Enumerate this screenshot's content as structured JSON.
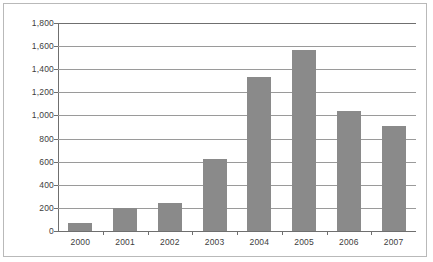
{
  "chart_data": {
    "type": "bar",
    "title": "",
    "subtitle": "",
    "xlabel": "",
    "ylabel": "",
    "categories": [
      "2000",
      "2001",
      "2002",
      "2003",
      "2004",
      "2005",
      "2006",
      "2007"
    ],
    "values": [
      70,
      200,
      240,
      625,
      1330,
      1570,
      1040,
      910
    ],
    "series": [
      {
        "name": "",
        "values": [
          70,
          200,
          240,
          625,
          1330,
          1570,
          1040,
          910
        ]
      }
    ],
    "ylim": [
      0,
      1800
    ],
    "ytick_values": [
      0,
      200,
      400,
      600,
      800,
      1000,
      1200,
      1400,
      1600,
      1800
    ],
    "ytick_labels": [
      "0",
      "200",
      "400",
      "600",
      "800",
      "1,000",
      "1,200",
      "1,400",
      "1,600",
      "1,800"
    ],
    "grid": true,
    "legend": false,
    "legend_position": "none",
    "bar_color": "#8a8a8a",
    "gridline_color": "#9a9a9a",
    "axis_color": "#6f6f6f",
    "frame_color": "#b9b9b9",
    "background_color": "#ffffff",
    "text_color": "#3d3d3d",
    "annotations": []
  }
}
